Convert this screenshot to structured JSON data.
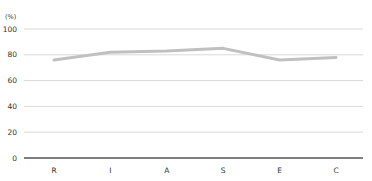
{
  "chart_data": {
    "type": "line",
    "title": "",
    "xlabel": "",
    "ylabel": "(%)",
    "categories": [
      "R",
      "I",
      "A",
      "S",
      "E",
      "C"
    ],
    "series": [
      {
        "name": "score",
        "values": [
          76,
          82,
          83,
          85,
          76,
          78
        ],
        "color": "#c0c0c0"
      }
    ],
    "ylim": [
      0,
      100
    ],
    "yticks": [
      0,
      20,
      40,
      60,
      80,
      100
    ],
    "grid": true,
    "legend": "none"
  },
  "colors": {
    "grid": "#d9d9d9",
    "axis": "#555555",
    "line": "#c0c0c0"
  }
}
